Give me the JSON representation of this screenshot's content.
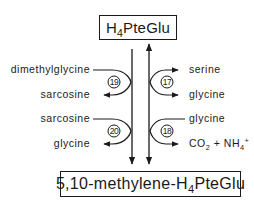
{
  "diagram": {
    "type": "metabolic-pathway",
    "top_compound": {
      "prefix": "H",
      "sub": "4",
      "suffix": "PteGlu"
    },
    "bottom_compound": {
      "prefix": "5,10-methylene-H",
      "sub": "4",
      "suffix": "PteGlu"
    },
    "left_reactions": [
      {
        "step": "19",
        "substrate": "dimethylglycine",
        "product": "sarcosine"
      },
      {
        "step": "20",
        "substrate": "sarcosine",
        "product": "glycine"
      }
    ],
    "right_reactions": [
      {
        "step": "17",
        "substrate": "serine",
        "product": "glycine",
        "direction": "reversible"
      },
      {
        "step": "18",
        "substrate": "glycine",
        "product_parts": {
          "co": "CO",
          "co_sub": "2",
          "plus": " + NH",
          "nh_sub": "4",
          "nh_sup": "+"
        }
      }
    ],
    "colors": {
      "ink": "#1a1a1a",
      "background": "#ffffff"
    }
  }
}
